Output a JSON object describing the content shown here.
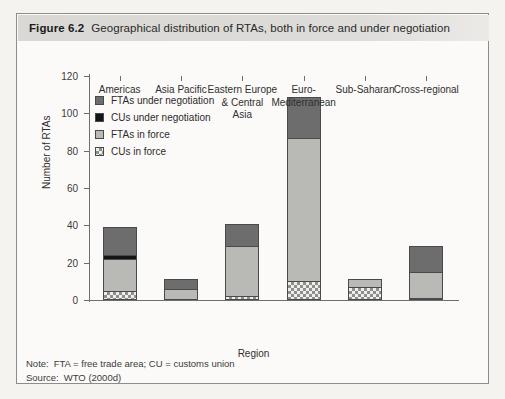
{
  "figure": {
    "number": "Figure 6.2",
    "title": "Geographical distribution of RTAs, both in force and under negotiation"
  },
  "footer": {
    "note_key": "Note:",
    "note_text": "FTA = free trade area; CU = customs union",
    "source_key": "Source:",
    "source_text": "WTO (2000d)"
  },
  "legend": {
    "items": [
      {
        "label": "FTAs under negotiation",
        "swatch": "fta-neg",
        "color": "#6d6d6d"
      },
      {
        "label": "CUs under negotiation",
        "swatch": "cu-neg",
        "color": "#151515"
      },
      {
        "label": "FTAs in force",
        "swatch": "fta-force",
        "color": "#b9b9b6"
      },
      {
        "label": "CUs in force",
        "swatch": "cu-force",
        "color": "#efeeea"
      }
    ]
  },
  "chart_data": {
    "type": "bar",
    "stacked": true,
    "title": "Geographical distribution of RTAs, both in force and under negotiation",
    "xlabel": "Region",
    "ylabel": "Number of RTAs",
    "ylim": [
      0,
      120
    ],
    "yticks": [
      0,
      20,
      40,
      60,
      80,
      100,
      120
    ],
    "grid": false,
    "legend_position": "upper-left-inside",
    "categories": [
      "Americas",
      "Asia Pacific",
      "Eastern Europe & Central Asia",
      "Euro-Mediterranean",
      "Sub-Saharan",
      "Cross-regional"
    ],
    "category_lines": [
      [
        "Americas"
      ],
      [
        "Asia Pacific"
      ],
      [
        "Eastern Europe",
        "& Central",
        "Asia"
      ],
      [
        "Euro-",
        "Mediterranean"
      ],
      [
        "Sub-Saharan"
      ],
      [
        "Cross-regional"
      ]
    ],
    "series": [
      {
        "name": "CUs in force",
        "values": [
          5,
          0,
          2,
          10,
          7,
          1
        ]
      },
      {
        "name": "FTAs in force",
        "values": [
          17,
          6,
          27,
          77,
          4,
          14
        ]
      },
      {
        "name": "CUs under negotiation",
        "values": [
          2,
          0,
          0,
          0,
          0,
          0
        ]
      },
      {
        "name": "FTAs under negotiation",
        "values": [
          15,
          5,
          12,
          22,
          0,
          14
        ]
      }
    ],
    "totals": [
      39,
      11,
      41,
      109,
      11,
      29
    ]
  }
}
